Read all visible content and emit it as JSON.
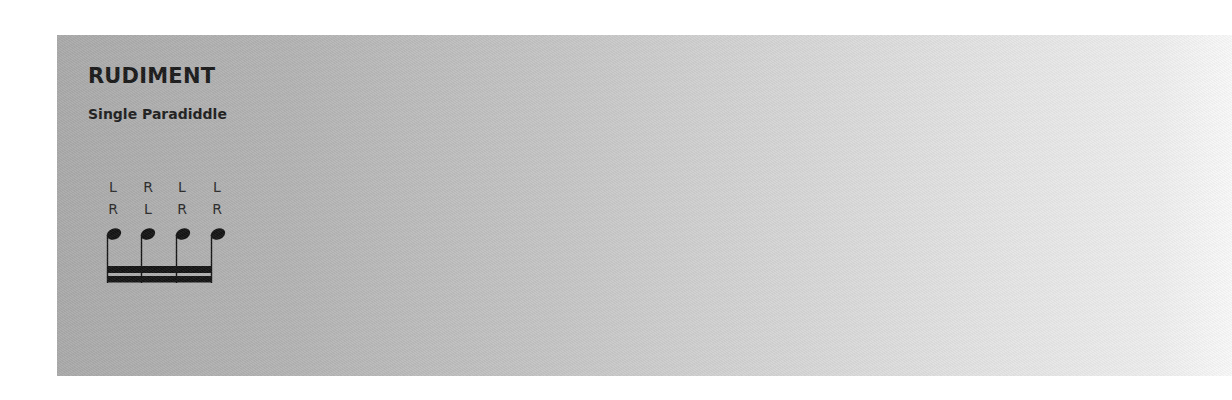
{
  "section": {
    "title": "RUDIMENT",
    "rudiment_name": "Single Paradiddle"
  },
  "stickings": {
    "row1": [
      "L",
      "R",
      "L",
      "L"
    ],
    "row2": [
      "R",
      "L",
      "R",
      "R"
    ]
  },
  "notation": {
    "note_count": 4,
    "note_value": "sixteenth",
    "beams": 2,
    "ink_color": "#141414"
  }
}
